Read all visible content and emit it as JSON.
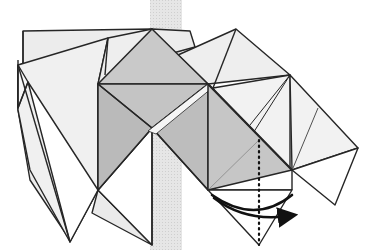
{
  "diagram": {
    "type": "origami-fold-step",
    "description": "Folding diagram showing a partially folded model with a valley fold indicated by a dotted line and a curved arrow showing the flap folding to the right",
    "colors": {
      "background": "#ffffff",
      "band": "#e3e3e3",
      "light_paper": "#ececec",
      "mid_paper": "#d6d6d6",
      "dark_paper": "#bdbdbd",
      "white_paper": "#ffffff",
      "line": "#262626",
      "arrow": "#111111"
    },
    "fold_line": {
      "style": "dotted",
      "x": 259,
      "y_start": 140,
      "y_end": 245
    },
    "arrow": {
      "direction": "right",
      "style": "curved"
    }
  }
}
